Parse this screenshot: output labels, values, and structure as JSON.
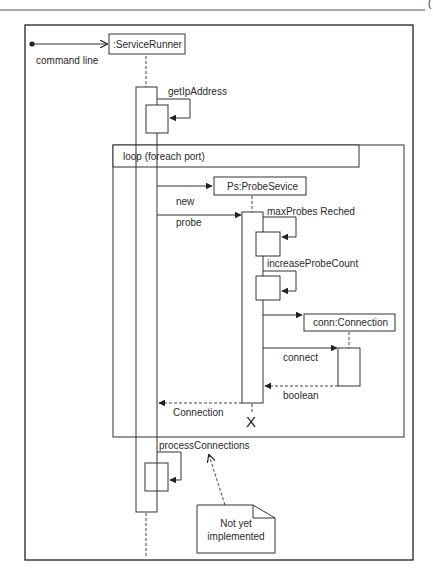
{
  "diagram": {
    "type": "uml-sequence",
    "page_marker": "(",
    "entry": {
      "label": "command line"
    },
    "lifelines": [
      {
        "id": "service-runner",
        "label": ":ServiceRunner"
      },
      {
        "id": "probe-service",
        "label": "Ps:ProbeSevice"
      },
      {
        "id": "connection",
        "label": "conn:Connection"
      }
    ],
    "fragment": {
      "kind": "loop",
      "label": "loop (foreach port)"
    },
    "messages": [
      {
        "label": "getIpAddress",
        "from": "service-runner",
        "to": "service-runner",
        "kind": "self"
      },
      {
        "label": "new",
        "from": "service-runner",
        "to": "probe-service",
        "kind": "create"
      },
      {
        "label": "probe",
        "from": "service-runner",
        "to": "probe-service",
        "kind": "sync"
      },
      {
        "label": "maxProbes Reched",
        "from": "probe-service",
        "to": "probe-service",
        "kind": "self"
      },
      {
        "label": "increaseProbeCount",
        "from": "probe-service",
        "to": "probe-service",
        "kind": "self"
      },
      {
        "label": "",
        "from": "probe-service",
        "to": "connection",
        "kind": "create"
      },
      {
        "label": "connect",
        "from": "probe-service",
        "to": "connection",
        "kind": "sync"
      },
      {
        "label": "boolean",
        "from": "connection",
        "to": "probe-service",
        "kind": "return"
      },
      {
        "label": "Connection",
        "from": "probe-service",
        "to": "service-runner",
        "kind": "return"
      },
      {
        "label": "processConnections",
        "from": "service-runner",
        "to": "service-runner",
        "kind": "self"
      }
    ],
    "note": {
      "line1": "Not yet",
      "line2": "implemented"
    },
    "destroy_marker": "X"
  }
}
